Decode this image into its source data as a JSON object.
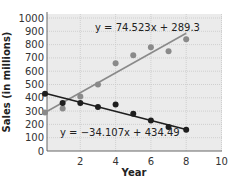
{
  "chart_data": {
    "type": "scatter",
    "title": "",
    "xlabel": "Year",
    "ylabel": "Sales (in millions)",
    "xlim": [
      0,
      10
    ],
    "ylim": [
      0,
      1000
    ],
    "x_ticks": [
      "2",
      "4",
      "6",
      "8",
      "10"
    ],
    "y_ticks": [
      "0",
      "100",
      "200",
      "300",
      "400",
      "500",
      "600",
      "700",
      "800",
      "900",
      "1000"
    ],
    "grid": true,
    "series": [
      {
        "name": "increasing",
        "color": "#8a8a8a",
        "x": [
          0,
          1,
          2,
          3,
          4,
          5,
          6,
          7,
          8
        ],
        "values": [
          290,
          320,
          410,
          500,
          660,
          720,
          780,
          750,
          840
        ],
        "trendline": {
          "slope": 74.523,
          "intercept": 289.3,
          "label": "y = 74.523x + 289.3"
        }
      },
      {
        "name": "decreasing",
        "color": "#1e1e1e",
        "x": [
          0,
          1,
          2,
          3,
          4,
          5,
          6,
          7,
          8
        ],
        "values": [
          430,
          360,
          360,
          330,
          350,
          280,
          230,
          180,
          160
        ],
        "trendline": {
          "slope": -34.107,
          "intercept": 434.49,
          "label": "y = −34.107x + 434.49"
        }
      }
    ]
  }
}
